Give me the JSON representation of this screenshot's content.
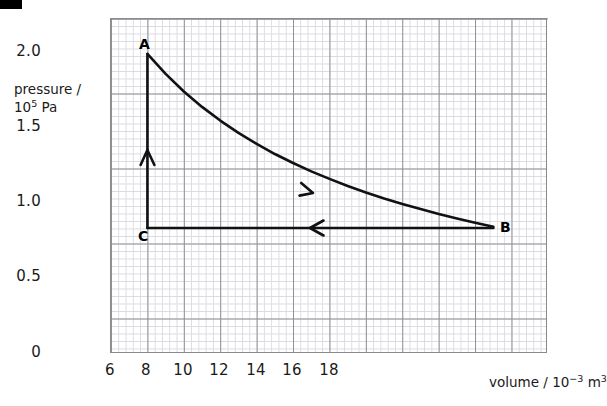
{
  "figure": {
    "corner_marker_color": "#000000",
    "curve_color": "#111111",
    "grid_minor_color": "#d9d9e2",
    "grid_major_color": "#8f8f96"
  },
  "axes": {
    "y_title_line1": "pressure /",
    "y_title_line2_base": "10",
    "y_title_line2_exp": "5",
    "y_title_line2_unit": " Pa",
    "x_title_base": "volume / 10",
    "x_title_exp": "−3",
    "x_title_unit": " m",
    "x_title_unit_exp": "3"
  },
  "chart_data": {
    "type": "line",
    "title": "",
    "subtitle": "",
    "xlabel": "volume / 10⁻³ m³",
    "ylabel": "pressure / 10⁵ Pa",
    "xlim": [
      6,
      18
    ],
    "ylim": [
      0,
      2.233
    ],
    "xticks": [
      6,
      8,
      10,
      12,
      14,
      16,
      18
    ],
    "xticklabels": [
      "6",
      "8",
      "10",
      "12",
      "14",
      "16",
      "18"
    ],
    "yticks": [
      0,
      0.5,
      1.0,
      1.5,
      2.0
    ],
    "yticklabels": [
      "0",
      "0.5",
      "1.0",
      "1.5",
      "2.0"
    ],
    "x_minor_step": 0.4,
    "y_minor_step": 0.1,
    "grid": true,
    "legend": "none",
    "points": [
      {
        "label": "A",
        "x": 7.0,
        "y": 2.0
      },
      {
        "label": "B",
        "x": 16.5,
        "y": 0.84
      },
      {
        "label": "C",
        "x": 7.0,
        "y": 0.84
      }
    ],
    "series": [
      {
        "name": "A to B (isothermal expansion)",
        "from": "A",
        "to": "B",
        "shape": "curve",
        "direction": "forward",
        "arrow_at": {
          "x": 11.5,
          "y": 1.25
        },
        "x": [
          7.0,
          7.5,
          8.0,
          8.5,
          9.0,
          9.5,
          10.0,
          10.5,
          11.0,
          11.5,
          12.0,
          12.5,
          13.0,
          13.5,
          14.0,
          14.5,
          15.0,
          15.5,
          16.0,
          16.5
        ],
        "y": [
          2.0,
          1.867,
          1.75,
          1.647,
          1.556,
          1.474,
          1.4,
          1.333,
          1.273,
          1.217,
          1.167,
          1.12,
          1.077,
          1.037,
          1.0,
          0.966,
          0.933,
          0.903,
          0.875,
          0.848
        ]
      },
      {
        "name": "B to C (isobaric compression)",
        "from": "B",
        "to": "C",
        "shape": "straight",
        "direction": "reverse",
        "arrow_at": {
          "x": 11.5,
          "y": 0.84
        },
        "x": [
          16.5,
          7.0
        ],
        "y": [
          0.84,
          0.84
        ]
      },
      {
        "name": "C to A (isochoric pressurisation)",
        "from": "C",
        "to": "A",
        "shape": "straight",
        "direction": "up",
        "arrow_at": {
          "x": 7.0,
          "y": 1.3
        },
        "x": [
          7.0,
          7.0
        ],
        "y": [
          0.84,
          2.0
        ]
      }
    ]
  }
}
